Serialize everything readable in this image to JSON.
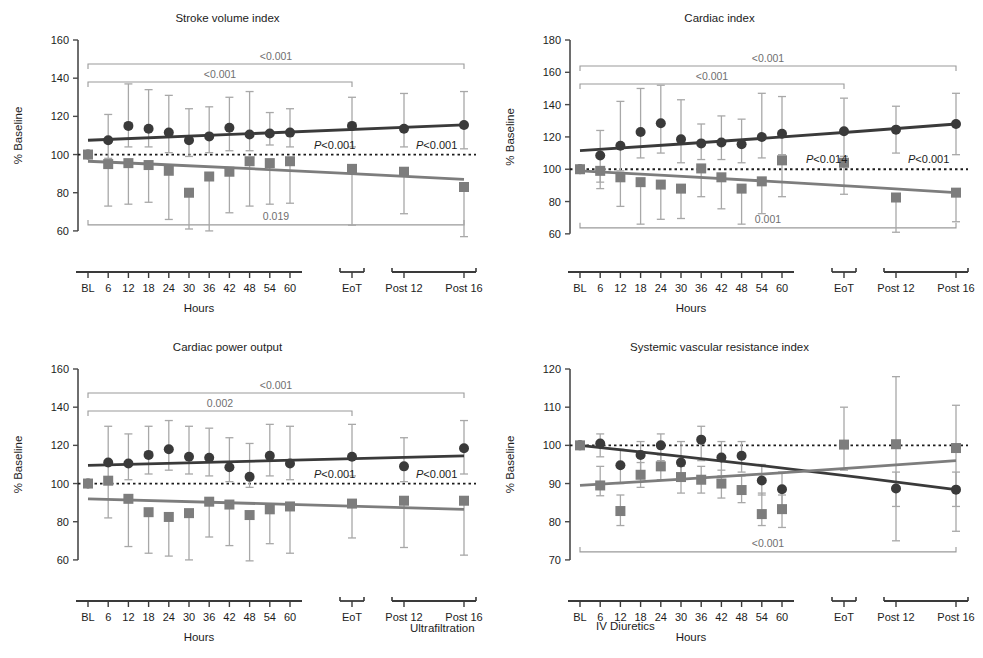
{
  "figure": {
    "width": 983,
    "height": 658,
    "legend": {
      "ultrafiltration_label": "Ultrafiltration",
      "iv_diuretics_label": "IV Diuretics",
      "ultrafiltration_color": "#3a3a3a",
      "iv_diuretics_color": "#7d7d7d",
      "ultrafiltration_marker": "circle",
      "iv_diuretics_marker": "square"
    },
    "shared": {
      "xlabel": "Hours",
      "ylabel": "% Baseline",
      "baseline_value": 100,
      "categories": [
        "BL",
        "6",
        "12",
        "18",
        "24",
        "30",
        "36",
        "42",
        "48",
        "54",
        "60",
        "EoT",
        "Post 12",
        "Post 16"
      ],
      "axis_group_breaks": [
        [
          0,
          10
        ],
        [
          11,
          11
        ],
        [
          12,
          13
        ]
      ]
    }
  },
  "chart_data": [
    {
      "id": "stroke-volume-index",
      "type": "scatter",
      "title": "Stroke volume index",
      "xlabel": "Hours",
      "ylabel": "% Baseline",
      "ylim": [
        50,
        160
      ],
      "yticks": [
        60,
        80,
        100,
        120,
        140,
        160
      ],
      "grid": false,
      "baseline": 100,
      "categories": [
        "BL",
        "6",
        "12",
        "18",
        "24",
        "30",
        "36",
        "42",
        "48",
        "54",
        "60",
        "EoT",
        "Post 12",
        "Post 16"
      ],
      "series": [
        {
          "name": "Ultrafiltration",
          "marker": "circle",
          "color": "#3a3a3a",
          "values": [
            100,
            107.5,
            115,
            113.5,
            111.5,
            107.5,
            109.5,
            114,
            110.5,
            111,
            111.5,
            115,
            113.5,
            115.5
          ],
          "err_low": [
            100,
            98,
            104,
            104,
            101,
            99,
            101,
            102,
            102,
            105,
            104,
            104,
            104,
            103
          ],
          "err_high": [
            100,
            121,
            137,
            134,
            131,
            124,
            125,
            130,
            133,
            122,
            124,
            130,
            132,
            133
          ],
          "trend": [
            107.5,
            115.5
          ]
        },
        {
          "name": "IV Diuretics",
          "marker": "square",
          "color": "#7d7d7d",
          "values": [
            100,
            95,
            95.5,
            94.5,
            91.5,
            80,
            88.5,
            91,
            96.5,
            95.5,
            96.5,
            92.5,
            91,
            83
          ],
          "err_low": [
            100,
            73,
            74,
            75,
            66,
            61,
            60,
            69.5,
            73,
            74,
            74.5,
            63,
            69,
            57
          ],
          "err_high": [
            100,
            96.5,
            97,
            96,
            93,
            81.5,
            90,
            92.5,
            98,
            97,
            98,
            94,
            92.5,
            85
          ],
          "trend": [
            96.5,
            87
          ]
        }
      ],
      "annotations": [
        {
          "text": "<0.001",
          "bracket": "top-full",
          "color": "#9a9a9a"
        },
        {
          "text": "<0.001",
          "bracket": "top-eot",
          "color": "#9a9a9a"
        },
        {
          "text": "0.019",
          "bracket": "bottom-full",
          "color": "#9a9a9a"
        },
        {
          "text": "P<0.001",
          "position": "eot-inline",
          "color": "#1c1c1c"
        },
        {
          "text": "P<0.001",
          "position": "post-inline",
          "color": "#1c1c1c"
        }
      ]
    },
    {
      "id": "cardiac-index",
      "type": "scatter",
      "title": "Cardiac index",
      "xlabel": "Hours",
      "ylabel": "% Baseline",
      "ylim": [
        50,
        180
      ],
      "yticks": [
        60,
        80,
        100,
        120,
        140,
        160,
        180
      ],
      "grid": false,
      "baseline": 100,
      "categories": [
        "BL",
        "6",
        "12",
        "18",
        "24",
        "30",
        "36",
        "42",
        "48",
        "54",
        "60",
        "EoT",
        "Post 12",
        "Post 16"
      ],
      "series": [
        {
          "name": "Ultrafiltration",
          "marker": "circle",
          "color": "#3a3a3a",
          "values": [
            100,
            108.5,
            114.5,
            123,
            128.5,
            118.5,
            116,
            116.5,
            115.5,
            120,
            122,
            123.5,
            124.5,
            128
          ],
          "err_low": [
            100,
            92,
            99,
            107,
            110,
            104,
            106,
            106,
            104,
            107,
            109,
            108,
            110,
            109
          ],
          "err_high": [
            100,
            124,
            142,
            150,
            152,
            143,
            128,
            133,
            131,
            147,
            145,
            144,
            139,
            147
          ],
          "trend": [
            111.5,
            128
          ]
        },
        {
          "name": "IV Diuretics",
          "marker": "square",
          "color": "#7d7d7d",
          "values": [
            100,
            99,
            95,
            92,
            90.5,
            88,
            100.5,
            95,
            88,
            92.5,
            105.5,
            104,
            82.5,
            85.5
          ],
          "err_low": [
            100,
            88,
            77,
            66,
            69,
            69.5,
            83,
            75.5,
            66,
            72.5,
            83,
            84.5,
            61,
            67.5
          ],
          "err_high": [
            100,
            100,
            96,
            93,
            92,
            89.5,
            102,
            96,
            89.5,
            94,
            107,
            105.5,
            84,
            87
          ],
          "trend": [
            99,
            85.5
          ]
        }
      ],
      "annotations": [
        {
          "text": "<0.001",
          "bracket": "top-full",
          "color": "#9a9a9a"
        },
        {
          "text": "<0.001",
          "bracket": "top-eot",
          "color": "#9a9a9a"
        },
        {
          "text": "0.001",
          "bracket": "bottom-full",
          "color": "#9a9a9a"
        },
        {
          "text": "P<0.014",
          "position": "eot-inline",
          "color": "#1c1c1c"
        },
        {
          "text": "P<0.001",
          "position": "post-inline",
          "color": "#1c1c1c"
        }
      ]
    },
    {
      "id": "cardiac-power-output",
      "type": "scatter",
      "title": "Cardiac power output",
      "xlabel": "Hours",
      "ylabel": "% Baseline",
      "ylim": [
        50,
        160
      ],
      "yticks": [
        60,
        80,
        100,
        120,
        140,
        160
      ],
      "grid": false,
      "baseline": 100,
      "categories": [
        "BL",
        "6",
        "12",
        "18",
        "24",
        "30",
        "36",
        "42",
        "48",
        "54",
        "60",
        "EoT",
        "Post 12",
        "Post 16"
      ],
      "series": [
        {
          "name": "Ultrafiltration",
          "marker": "circle",
          "color": "#3a3a3a",
          "values": [
            100,
            111,
            110.5,
            115,
            118,
            114,
            113.5,
            108.5,
            103.5,
            114.5,
            110.5,
            114,
            109,
            118.5
          ],
          "err_low": [
            100,
            101,
            102,
            105,
            107,
            105,
            104,
            101,
            98,
            104,
            102,
            104,
            101,
            105
          ],
          "err_high": [
            100,
            130,
            126,
            130,
            133,
            130,
            129,
            124,
            121,
            131,
            130,
            131,
            124,
            133
          ],
          "trend": [
            109.5,
            114.5
          ]
        },
        {
          "name": "IV Diuretics",
          "marker": "square",
          "color": "#7d7d7d",
          "values": [
            100,
            101.5,
            92,
            85,
            82.5,
            84.5,
            90.5,
            89,
            83.5,
            86.5,
            88,
            89.5,
            91,
            91
          ],
          "err_low": [
            100,
            82,
            67,
            63.5,
            62,
            60,
            72,
            67.5,
            59.5,
            68.5,
            63.5,
            71.5,
            66.5,
            62.5
          ],
          "err_high": [
            100,
            103,
            93.5,
            86.5,
            84,
            86,
            92,
            90.5,
            85,
            88,
            89.5,
            91,
            92.5,
            92.5
          ],
          "trend": [
            92,
            86.5
          ]
        }
      ],
      "annotations": [
        {
          "text": "<0.001",
          "bracket": "top-full",
          "color": "#9a9a9a"
        },
        {
          "text": "0.002",
          "bracket": "top-eot",
          "color": "#9a9a9a"
        },
        {
          "text": "P<0.001",
          "position": "eot-inline",
          "color": "#1c1c1c"
        },
        {
          "text": "P<0.001",
          "position": "post-inline",
          "color": "#1c1c1c"
        }
      ]
    },
    {
      "id": "systemic-vascular-resistance-index",
      "type": "scatter",
      "title": "Systemic vascular resistance index",
      "xlabel": "Hours",
      "ylabel": "% Baseline",
      "ylim": [
        65,
        120
      ],
      "yticks": [
        70,
        80,
        90,
        100,
        110,
        120
      ],
      "grid": false,
      "baseline": 100,
      "categories": [
        "BL",
        "6",
        "12",
        "18",
        "24",
        "30",
        "36",
        "42",
        "48",
        "54",
        "60",
        "EoT",
        "Post 12",
        "Post 16"
      ],
      "series": [
        {
          "name": "Ultrafiltration",
          "marker": "circle",
          "color": "#3a3a3a",
          "values": [
            100,
            100.5,
            94.8,
            97.5,
            100,
            95.5,
            101.5,
            96.8,
            97.3,
            90.8,
            88.5,
            null,
            88.7,
            88.4
          ],
          "err_low": [
            100,
            97,
            90,
            93,
            96,
            91,
            96,
            92,
            93,
            87,
            84,
            null,
            84,
            84
          ],
          "err_high": [
            100,
            103,
            99,
            101,
            103,
            101,
            105,
            101,
            101,
            95,
            93,
            null,
            93,
            93
          ],
          "trend": [
            100,
            88.4
          ]
        },
        {
          "name": "IV Diuretics",
          "marker": "square",
          "color": "#7d7d7d",
          "values": [
            100,
            89.5,
            82.8,
            92.3,
            94.5,
            91.7,
            91,
            90,
            88.3,
            82,
            83.3,
            100.2,
            100.3,
            99.3
          ],
          "err_low": [
            100,
            86.8,
            79,
            89,
            91,
            87.5,
            87.5,
            86.2,
            85,
            79,
            78.5,
            93.5,
            75,
            77.5
          ],
          "err_high": [
            100,
            94.5,
            87,
            95.5,
            97.5,
            94.5,
            94.5,
            93.5,
            92,
            87.5,
            87,
            110,
            118,
            110.5
          ],
          "trend": [
            89.5,
            96
          ]
        }
      ],
      "annotations": [
        {
          "text": "<0.001",
          "bracket": "bottom-full",
          "color": "#9a9a9a"
        }
      ]
    }
  ]
}
